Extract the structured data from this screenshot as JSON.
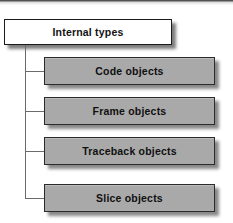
{
  "figure": {
    "kind": "hierarchy-tree-diagram",
    "colors": {
      "root_fill": "#ffffff",
      "root_border": "#1a1a1a",
      "child_fill": "#a9a9a9",
      "child_border": "#2b2b2b",
      "connector": "#6b6b6b",
      "text": "#101010",
      "background": "#ffffff"
    },
    "root": {
      "label": "Internal types"
    },
    "children": [
      {
        "label": "Code objects",
        "top": 57
      },
      {
        "label": "Frame objects",
        "top": 97
      },
      {
        "label": "Traceback objects",
        "top": 137
      },
      {
        "label": "Slice objects",
        "top": 184
      }
    ]
  }
}
